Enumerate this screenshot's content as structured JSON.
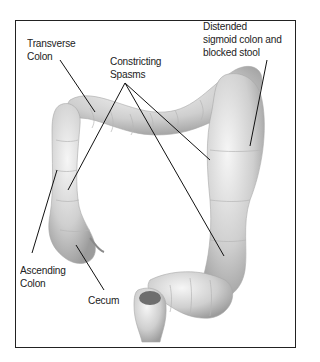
{
  "diagram": {
    "labels": [
      {
        "id": "transverse",
        "text": "Transverse\nColon"
      },
      {
        "id": "spasms",
        "text": "Constricting\nSpasms"
      },
      {
        "id": "distended",
        "text": "Distended\nsigmoid colon and\nblocked stool"
      },
      {
        "id": "ascending",
        "text": "Ascending\nColon"
      },
      {
        "id": "cecum",
        "text": "Cecum"
      }
    ],
    "colors": {
      "border": "#222222",
      "tissue_light": "#e6e6e6",
      "tissue_dark": "#9a9a9a",
      "leader": "#111111"
    }
  }
}
